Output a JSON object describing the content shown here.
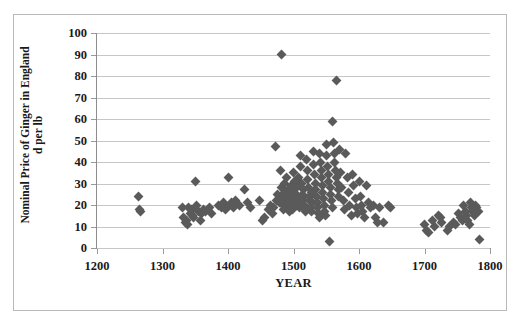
{
  "chart_data": {
    "type": "scatter",
    "title": "",
    "xlabel": "YEAR",
    "ylabel": "Nominal Price of Ginger in England d per lb",
    "ylabel_line1": "Nominal Price of Ginger in England",
    "ylabel_line2": "d per lb",
    "xlim": [
      1200,
      1800
    ],
    "ylim": [
      0,
      100
    ],
    "xticks": [
      1200,
      1300,
      1400,
      1500,
      1600,
      1700,
      1800
    ],
    "yticks": [
      0,
      10,
      20,
      30,
      40,
      50,
      60,
      70,
      80,
      90,
      100
    ],
    "grid": "horizontal",
    "legend": "none",
    "marker": "diamond",
    "marker_color": "#5a5a5a",
    "series": [
      {
        "name": "Nominal Price of Ginger",
        "points": [
          [
            1264,
            24
          ],
          [
            1265,
            18
          ],
          [
            1266,
            17
          ],
          [
            1330,
            19
          ],
          [
            1332,
            14
          ],
          [
            1335,
            12
          ],
          [
            1337,
            13
          ],
          [
            1338,
            11
          ],
          [
            1340,
            19
          ],
          [
            1342,
            16
          ],
          [
            1344,
            18
          ],
          [
            1346,
            15
          ],
          [
            1348,
            14
          ],
          [
            1350,
            31
          ],
          [
            1352,
            20
          ],
          [
            1355,
            17
          ],
          [
            1358,
            13
          ],
          [
            1360,
            16
          ],
          [
            1363,
            18
          ],
          [
            1366,
            17
          ],
          [
            1372,
            19
          ],
          [
            1375,
            16
          ],
          [
            1385,
            20
          ],
          [
            1390,
            19
          ],
          [
            1393,
            21
          ],
          [
            1396,
            18
          ],
          [
            1400,
            33
          ],
          [
            1402,
            20
          ],
          [
            1405,
            21
          ],
          [
            1408,
            19
          ],
          [
            1412,
            22
          ],
          [
            1418,
            20
          ],
          [
            1425,
            27
          ],
          [
            1430,
            21
          ],
          [
            1435,
            19
          ],
          [
            1448,
            22
          ],
          [
            1452,
            13
          ],
          [
            1455,
            14
          ],
          [
            1462,
            18
          ],
          [
            1465,
            20
          ],
          [
            1468,
            16
          ],
          [
            1470,
            19
          ],
          [
            1472,
            47
          ],
          [
            1474,
            22
          ],
          [
            1476,
            25
          ],
          [
            1478,
            21
          ],
          [
            1480,
            36
          ],
          [
            1481,
            28
          ],
          [
            1482,
            90
          ],
          [
            1483,
            24
          ],
          [
            1484,
            20
          ],
          [
            1485,
            18
          ],
          [
            1486,
            30
          ],
          [
            1487,
            26
          ],
          [
            1488,
            22
          ],
          [
            1489,
            19
          ],
          [
            1490,
            33
          ],
          [
            1491,
            23
          ],
          [
            1492,
            21
          ],
          [
            1493,
            27
          ],
          [
            1494,
            17
          ],
          [
            1495,
            24
          ],
          [
            1496,
            20
          ],
          [
            1497,
            29
          ],
          [
            1498,
            22
          ],
          [
            1499,
            18
          ],
          [
            1500,
            35
          ],
          [
            1501,
            26
          ],
          [
            1502,
            31
          ],
          [
            1503,
            23
          ],
          [
            1504,
            20
          ],
          [
            1505,
            28
          ],
          [
            1506,
            24
          ],
          [
            1507,
            21
          ],
          [
            1508,
            33
          ],
          [
            1509,
            19
          ],
          [
            1510,
            43
          ],
          [
            1511,
            38
          ],
          [
            1512,
            30
          ],
          [
            1513,
            25
          ],
          [
            1514,
            22
          ],
          [
            1515,
            27
          ],
          [
            1516,
            24
          ],
          [
            1517,
            20
          ],
          [
            1518,
            18
          ],
          [
            1519,
            17
          ],
          [
            1520,
            41
          ],
          [
            1521,
            36
          ],
          [
            1522,
            32
          ],
          [
            1523,
            28
          ],
          [
            1524,
            24
          ],
          [
            1525,
            22
          ],
          [
            1526,
            19
          ],
          [
            1527,
            17
          ],
          [
            1528,
            26
          ],
          [
            1529,
            21
          ],
          [
            1530,
            45
          ],
          [
            1531,
            39
          ],
          [
            1532,
            34
          ],
          [
            1533,
            30
          ],
          [
            1534,
            27
          ],
          [
            1535,
            24
          ],
          [
            1536,
            21
          ],
          [
            1537,
            19
          ],
          [
            1538,
            16
          ],
          [
            1539,
            14
          ],
          [
            1540,
            44
          ],
          [
            1541,
            40
          ],
          [
            1542,
            36
          ],
          [
            1543,
            33
          ],
          [
            1544,
            29
          ],
          [
            1545,
            26
          ],
          [
            1546,
            23
          ],
          [
            1547,
            20
          ],
          [
            1548,
            17
          ],
          [
            1549,
            15
          ],
          [
            1550,
            48
          ],
          [
            1551,
            43
          ],
          [
            1552,
            38
          ],
          [
            1553,
            34
          ],
          [
            1554,
            31
          ],
          [
            1555,
            3
          ],
          [
            1556,
            28
          ],
          [
            1557,
            25
          ],
          [
            1558,
            22
          ],
          [
            1559,
            19
          ],
          [
            1560,
            59
          ],
          [
            1561,
            49
          ],
          [
            1562,
            44
          ],
          [
            1563,
            40
          ],
          [
            1564,
            36
          ],
          [
            1565,
            78
          ],
          [
            1566,
            33
          ],
          [
            1567,
            30
          ],
          [
            1568,
            27
          ],
          [
            1569,
            24
          ],
          [
            1570,
            46
          ],
          [
            1572,
            35
          ],
          [
            1574,
            28
          ],
          [
            1576,
            22
          ],
          [
            1578,
            18
          ],
          [
            1580,
            44
          ],
          [
            1582,
            33
          ],
          [
            1584,
            26
          ],
          [
            1586,
            20
          ],
          [
            1588,
            15
          ],
          [
            1590,
            34
          ],
          [
            1592,
            29
          ],
          [
            1594,
            23
          ],
          [
            1596,
            19
          ],
          [
            1598,
            16
          ],
          [
            1600,
            31
          ],
          [
            1602,
            24
          ],
          [
            1604,
            20
          ],
          [
            1606,
            17
          ],
          [
            1608,
            14
          ],
          [
            1612,
            29
          ],
          [
            1615,
            21
          ],
          [
            1618,
            19
          ],
          [
            1622,
            20
          ],
          [
            1625,
            14
          ],
          [
            1628,
            12
          ],
          [
            1632,
            19
          ],
          [
            1638,
            12
          ],
          [
            1645,
            20
          ],
          [
            1648,
            19
          ],
          [
            1700,
            11
          ],
          [
            1703,
            8
          ],
          [
            1706,
            7
          ],
          [
            1712,
            13
          ],
          [
            1715,
            10
          ],
          [
            1722,
            15
          ],
          [
            1724,
            14
          ],
          [
            1726,
            12
          ],
          [
            1735,
            8
          ],
          [
            1738,
            10
          ],
          [
            1745,
            12
          ],
          [
            1748,
            11
          ],
          [
            1752,
            16
          ],
          [
            1755,
            14
          ],
          [
            1758,
            13
          ],
          [
            1760,
            20
          ],
          [
            1762,
            17
          ],
          [
            1764,
            15
          ],
          [
            1766,
            13
          ],
          [
            1768,
            11
          ],
          [
            1770,
            21
          ],
          [
            1772,
            19
          ],
          [
            1774,
            17
          ],
          [
            1776,
            15
          ],
          [
            1778,
            20
          ],
          [
            1780,
            19
          ],
          [
            1782,
            17
          ],
          [
            1784,
            4
          ]
        ]
      }
    ]
  }
}
